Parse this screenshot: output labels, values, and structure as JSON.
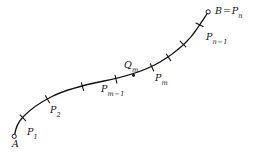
{
  "figure": {
    "type": "geometric-curve-diagram",
    "background_color": "#ffffff",
    "curve_color": "#111111",
    "curve_width": 1.3,
    "tick_color": "#111111",
    "endpoint_marker": "open-circle",
    "interior_marker": "tick-cross",
    "sample_point_marker": "filled-dot"
  },
  "labels": {
    "start": {
      "name": "A",
      "text": "A",
      "x": 12,
      "y": 139
    },
    "p1": {
      "name": "P1",
      "base": "P",
      "sub": "1",
      "x": 27,
      "y": 127
    },
    "p2": {
      "name": "P2",
      "base": "P",
      "sub": "2",
      "x": 50,
      "y": 105
    },
    "pm_minus_1": {
      "name": "Pm-1",
      "base": "P",
      "sub": "m",
      "sub_op": "−",
      "sub_tail": "1",
      "x": 101,
      "y": 84
    },
    "qm": {
      "name": "Qm",
      "base": "Q",
      "sub": "m",
      "x": 124,
      "y": 60
    },
    "pm": {
      "name": "Pm",
      "base": "P",
      "sub": "m",
      "x": 155,
      "y": 73
    },
    "pn_minus_1": {
      "name": "Pn-1",
      "base": "P",
      "sub": "n",
      "sub_op": "−",
      "sub_tail": "1",
      "x": 206,
      "y": 32
    },
    "end": {
      "name": "B = Pn",
      "base": "B",
      "op": "=",
      "base2": "P",
      "sub": "n",
      "x": 215,
      "y": 6
    }
  },
  "geometry": {
    "curve_path": "M 14.5 135.5 C 15.5 128.5 18.0 122.0 23.0 117.0 C 30.0 109.5 40.0 102.5 52.0 96.5 C 66.0 89.5 84.0 85.0 104.0 81.0 C 124.0 77.0 144.0 71.5 160.0 62.0 C 176.0 52.5 190.0 40.0 197.5 28.0 C 203.5 19.0 206.5 15.0 207.8 12.5",
    "endpoints": [
      {
        "name": "A",
        "cx": 14.2,
        "cy": 136.3,
        "r": 2.1
      },
      {
        "name": "B",
        "cx": 208.2,
        "cy": 11.8,
        "r": 2.1
      }
    ],
    "ticks": [
      {
        "name": "P1",
        "x": 22.8,
        "y": 117.8,
        "angle": -44
      },
      {
        "name": "P2",
        "x": 47.5,
        "y": 99.2,
        "angle": -30
      },
      {
        "name": "tick-3",
        "x": 82.5,
        "y": 86.6,
        "angle": -16
      },
      {
        "name": "Pm-1",
        "x": 116.0,
        "y": 79.2,
        "angle": -13
      },
      {
        "name": "Pm",
        "x": 152.0,
        "y": 67.4,
        "angle": -25
      },
      {
        "name": "tick-6",
        "x": 168.5,
        "y": 57.3,
        "angle": -33
      },
      {
        "name": "tick-7",
        "x": 183.0,
        "y": 44.0,
        "angle": -45
      },
      {
        "name": "Pn-1",
        "x": 199.5,
        "y": 24.8,
        "angle": -64
      }
    ],
    "sample_points": [
      {
        "name": "Qm",
        "cx": 133.5,
        "cy": 75.3,
        "r": 1.5
      }
    ],
    "tick_half_length": 4.0
  }
}
